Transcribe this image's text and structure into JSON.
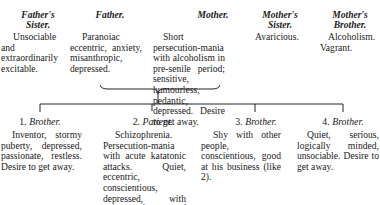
{
  "parents": [
    {
      "relation": "Father's Sister.",
      "description": "Unsociable and extraordinarily excitable."
    },
    {
      "relation": "Father.",
      "description": "Paranoiac eccentric, anxiety, misanthropic, depressed."
    },
    {
      "relation": "Mother.",
      "description": "Short persecution-mania with alcoholism in pre-senile period; sensitive, humourless, pedantic, depressed. Desire to get away."
    },
    {
      "relation": "Mother's Sister.",
      "description": "Avaricious."
    },
    {
      "relation": "Mother's Brother.",
      "description": "Alcoholism. Vagrant."
    }
  ],
  "children": [
    {
      "number": "1.",
      "relation": "Brother.",
      "description": "Inventor, stormy puberty, depressed, passionate, restless. Desire to get away."
    },
    {
      "number": "2.",
      "relation": "Patient.",
      "description": "Schizophrenia. Persecution-mania with acute katatonic attacks. Quiet, eccentric, conscientious, depressed, with chronic feeling of inferiority and a strong capacity for phantasy."
    },
    {
      "number": "3.",
      "relation": "Brother.",
      "description": "Shy with other people, conscientious, good at his business (like 2)."
    },
    {
      "number": "4.",
      "relation": "Brother.",
      "description": "Quiet, serious, logically minded, unsociable. Desire to get away."
    }
  ]
}
